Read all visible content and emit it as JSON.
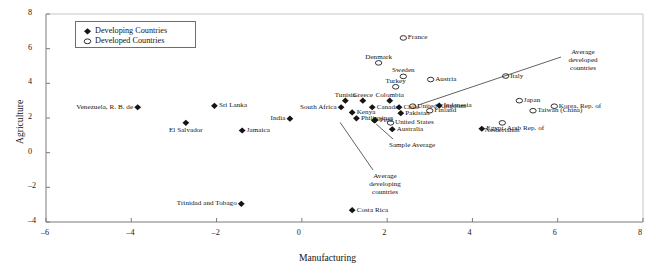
{
  "chart_data": {
    "type": "scatter",
    "title": "",
    "xlabel": "Manufacturing",
    "ylabel": "Agriculture",
    "xlim": [
      -6,
      8
    ],
    "ylim": [
      -4,
      8
    ],
    "xticks": [
      -6,
      -4,
      -2,
      0,
      2,
      4,
      6,
      8
    ],
    "yticks": [
      -4,
      -2,
      0,
      2,
      4,
      6,
      8
    ],
    "grid": false,
    "legend": {
      "position": "top-left",
      "entries": [
        {
          "label": "Developing Countries",
          "marker": "filled-diamond"
        },
        {
          "label": "Developed Countries",
          "marker": "open-ellipse"
        }
      ]
    },
    "series": [
      {
        "name": "Developing Countries",
        "marker": "filled-diamond",
        "points": [
          {
            "label": "Venezuela, R. B. de",
            "x": -3.85,
            "y": 2.62,
            "pos": "left"
          },
          {
            "label": "Sri Lanka",
            "x": -2.05,
            "y": 2.7,
            "pos": "right"
          },
          {
            "label": "El Salvador",
            "x": -2.72,
            "y": 1.72,
            "pos": "below"
          },
          {
            "label": "Jamaica",
            "x": -1.4,
            "y": 1.28,
            "pos": "right"
          },
          {
            "label": "India",
            "x": -0.28,
            "y": 1.96,
            "pos": "left"
          },
          {
            "label": "Trinidad and Tobago",
            "x": -1.42,
            "y": -2.95,
            "pos": "left"
          },
          {
            "label": "Costa Rica",
            "x": 1.18,
            "y": -3.32,
            "pos": "right"
          },
          {
            "label": "Tunisia",
            "x": 1.02,
            "y": 3.0,
            "pos": "above"
          },
          {
            "label": "Greece",
            "x": 1.43,
            "y": 3.0,
            "pos": "above"
          },
          {
            "label": "Colombia",
            "x": 2.06,
            "y": 3.0,
            "pos": "above"
          },
          {
            "label": "South Africa",
            "x": 0.92,
            "y": 2.62,
            "pos": "left"
          },
          {
            "label": "Canada",
            "x": 1.65,
            "y": 2.62,
            "pos": "right"
          },
          {
            "label": "Chile",
            "x": 2.28,
            "y": 2.62,
            "pos": "right"
          },
          {
            "label": "Kenya",
            "x": 1.18,
            "y": 2.32,
            "pos": "right"
          },
          {
            "label": "Pakistan",
            "x": 2.32,
            "y": 2.28,
            "pos": "right"
          },
          {
            "label": "Philippines",
            "x": 1.28,
            "y": 1.98,
            "pos": "right"
          },
          {
            "label": "Peru",
            "x": 1.72,
            "y": 1.88,
            "pos": "right"
          },
          {
            "label": "Indonesia",
            "x": 3.22,
            "y": 2.72,
            "pos": "right"
          },
          {
            "label": "Egypt, Arab Rep. of",
            "x": 4.22,
            "y": 1.38,
            "pos": "right"
          },
          {
            "label": "Australia",
            "x": 2.12,
            "y": 1.35,
            "pos": "right"
          },
          {
            "label": "Sample Average",
            "x": 1.7,
            "y": 1.86,
            "pos": "leader"
          }
        ]
      },
      {
        "name": "Developed Countries",
        "marker": "open-ellipse",
        "points": [
          {
            "label": "France",
            "x": 2.38,
            "y": 6.62,
            "pos": "right"
          },
          {
            "label": "Denmark",
            "x": 1.8,
            "y": 5.18,
            "pos": "above"
          },
          {
            "label": "Sweden",
            "x": 2.38,
            "y": 4.4,
            "pos": "above"
          },
          {
            "label": "Austria",
            "x": 3.02,
            "y": 4.22,
            "pos": "right"
          },
          {
            "label": "Turkey",
            "x": 2.2,
            "y": 3.8,
            "pos": "above"
          },
          {
            "label": "Italy",
            "x": 4.78,
            "y": 4.42,
            "pos": "right"
          },
          {
            "label": "United Kingdom",
            "x": 2.6,
            "y": 2.68,
            "pos": "right"
          },
          {
            "label": "Finland",
            "x": 3.0,
            "y": 2.42,
            "pos": "right"
          },
          {
            "label": "United States",
            "x": 2.08,
            "y": 1.72,
            "pos": "right"
          },
          {
            "label": "Netherlands",
            "x": 4.7,
            "y": 1.72,
            "pos": "below"
          },
          {
            "label": "Japan",
            "x": 5.1,
            "y": 3.0,
            "pos": "right"
          },
          {
            "label": "Korea, Rep. of",
            "x": 5.92,
            "y": 2.68,
            "pos": "right"
          },
          {
            "label": "Taiwan (China)",
            "x": 5.42,
            "y": 2.42,
            "pos": "right"
          }
        ]
      }
    ],
    "annotations": [
      {
        "text": "Average developed countries",
        "lines": [
          "Average",
          "developed",
          "countries"
        ],
        "target_x": 2.6,
        "target_y": 2.68
      },
      {
        "text": "Average developing countries",
        "lines": [
          "Average",
          "developing",
          "countries"
        ],
        "target_x": 0.92,
        "target_y": 1.98
      },
      {
        "text": "Sample Average",
        "lines": [
          "Sample Average"
        ],
        "target_x": 1.72,
        "target_y": 1.88
      }
    ]
  },
  "axis": {
    "xlabel": "Manufacturing",
    "ylabel": "Agriculture",
    "xtick_labels": [
      "–6",
      "–4",
      "–2",
      "0",
      "2",
      "4",
      "6",
      "8"
    ],
    "ytick_labels": [
      "–4",
      "–2",
      "0",
      "2",
      "4",
      "6",
      "8"
    ]
  },
  "legend": {
    "developing": "Developing Countries",
    "developed": "Developed Countries"
  },
  "annotation_text": {
    "avg_dev_1": "Average",
    "avg_dev_2": "developed",
    "avg_dev_3": "countries",
    "avg_ing_1": "Average",
    "avg_ing_2": "developing",
    "avg_ing_3": "countries",
    "sample_average": "Sample Average"
  }
}
